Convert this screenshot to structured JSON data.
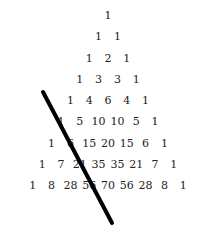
{
  "diagram": {
    "title": "",
    "rows": [
      [
        "1"
      ],
      [
        "1",
        "1"
      ],
      [
        "1",
        "2",
        "1"
      ],
      [
        "1",
        "3",
        "3",
        "1"
      ],
      [
        "1",
        "4",
        "6",
        "4",
        "1"
      ],
      [
        "1",
        "5",
        "10",
        "10",
        "5",
        "1"
      ],
      [
        "1",
        "6",
        "15",
        "20",
        "15",
        "6",
        "1"
      ],
      [
        "1",
        "7",
        "21",
        "35",
        "35",
        "21",
        "7",
        "1"
      ],
      [
        "1",
        "8",
        "28",
        "56",
        "70",
        "56",
        "28",
        "8",
        "1"
      ]
    ],
    "line": {
      "x1": 43,
      "y1": 92,
      "x2": 112,
      "y2": 223,
      "color": "#000000",
      "width": 4
    }
  }
}
